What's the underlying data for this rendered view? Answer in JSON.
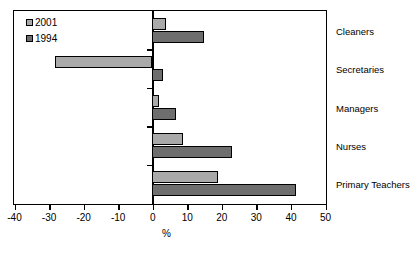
{
  "chart_data": {
    "type": "bar",
    "orientation": "horizontal",
    "title": "",
    "xlabel": "%",
    "ylabel": "",
    "xlim": [
      -40,
      50
    ],
    "xticks": [
      -40,
      -30,
      -20,
      -10,
      0,
      10,
      20,
      30,
      40,
      50
    ],
    "xtick_labels": [
      "-40",
      "-30",
      "-20",
      "-10",
      "0",
      "10",
      "20",
      "30",
      "40",
      "50"
    ],
    "grid": false,
    "legend_position": "top-left",
    "categories": [
      "Cleaners",
      "Secretaries",
      "Managers",
      "Nurses",
      "Primary Teachers"
    ],
    "series": [
      {
        "name": "2001",
        "color": "#a9a9a9",
        "values": [
          4,
          -28,
          2,
          9,
          19
        ]
      },
      {
        "name": "1994",
        "color": "#6e6e6e",
        "values": [
          15,
          3,
          7,
          23,
          41.5
        ]
      }
    ]
  }
}
